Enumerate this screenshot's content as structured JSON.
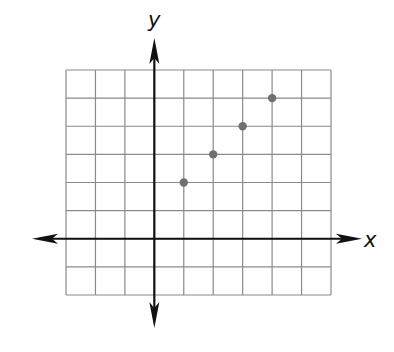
{
  "chart_data": {
    "type": "scatter",
    "title": "",
    "xlabel": "x",
    "ylabel": "y",
    "xlim": [
      -3,
      6
    ],
    "ylim": [
      -2,
      6
    ],
    "grid": true,
    "tick_labels_shown": false,
    "grid_step": 1,
    "series": [
      {
        "name": "points",
        "x": [
          1,
          2,
          3,
          4
        ],
        "y": [
          2,
          3,
          4,
          5
        ]
      }
    ],
    "colors": {
      "grid": "#8a8a8a",
      "axes": "#111111",
      "points": "#707070"
    }
  },
  "labels": {
    "x_axis": "x",
    "y_axis": "y"
  }
}
